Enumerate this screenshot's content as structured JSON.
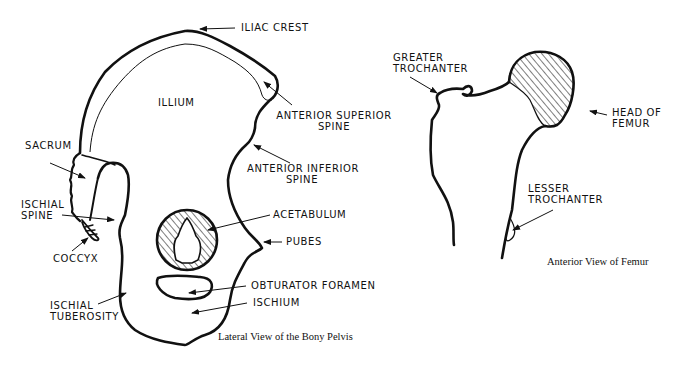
{
  "figure": {
    "pelvis": {
      "caption": "Lateral View of the Bony Pelvis",
      "labels": {
        "iliac_crest": "ILIAC CREST",
        "illium": "ILLIUM",
        "anterior_superior_spine_1": "ANTERIOR SUPERIOR",
        "anterior_superior_spine_2": "SPINE",
        "anterior_inferior_spine_1": "ANTERIOR INFERIOR",
        "anterior_inferior_spine_2": "SPINE",
        "sacrum": "SACRUM",
        "ischial_spine_1": "ISCHIAL",
        "ischial_spine_2": "SPINE",
        "coccyx": "COCCYX",
        "acetabulum": "ACETABULUM",
        "pubes": "PUBES",
        "obturator_foramen": "OBTURATOR FORAMEN",
        "ischium": "ISCHIUM",
        "ischial_tuberosity_1": "ISCHIAL",
        "ischial_tuberosity_2": "TUBEROSITY"
      }
    },
    "femur": {
      "caption": "Anterior View of Femur",
      "labels": {
        "greater_trochanter_1": "GREATER",
        "greater_trochanter_2": "TROCHANTER",
        "head_of_femur_1": "HEAD OF",
        "head_of_femur_2": "FEMUR",
        "lesser_trochanter_1": "LESSER",
        "lesser_trochanter_2": "TROCHANTER"
      }
    },
    "colors": {
      "ink": "#111111",
      "background": "#ffffff"
    }
  }
}
